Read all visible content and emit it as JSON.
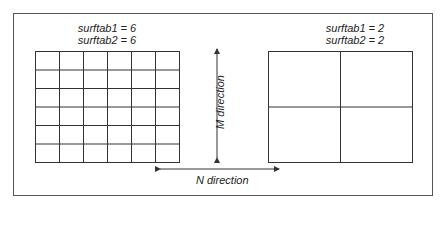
{
  "left_mesh": {
    "label_line1": "surftab1 = 6",
    "label_line2": "surftab2 = 6",
    "rows": 6,
    "cols": 6
  },
  "right_mesh": {
    "label_line1": "surftab1 = 2",
    "label_line2": "surftab2 = 2",
    "rows": 2,
    "cols": 2
  },
  "arrows": {
    "m_label": "M direction",
    "n_label": "N direction"
  },
  "colors": {
    "line": "#333333",
    "frame": "#555555"
  }
}
